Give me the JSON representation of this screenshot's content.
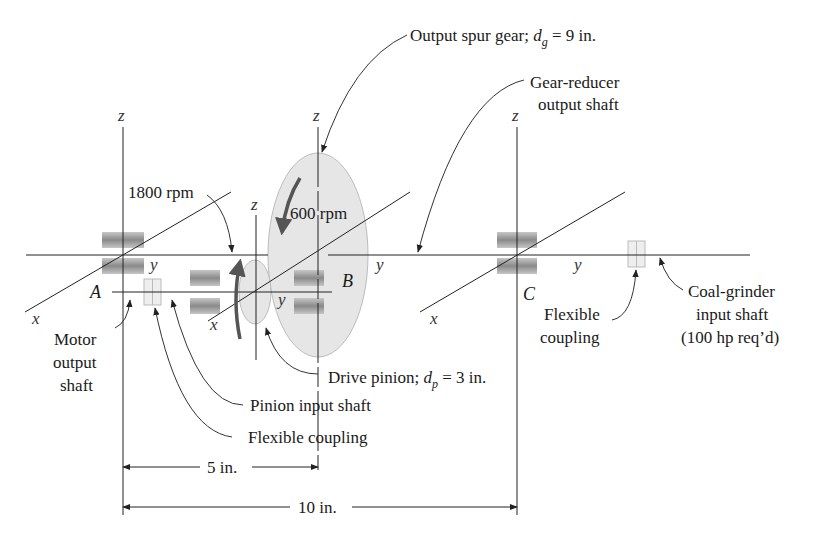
{
  "labels": {
    "output_gear": "Output spur gear; ",
    "output_gear_sym": "d",
    "output_gear_sub": "g",
    "output_gear_val": " = 9 in.",
    "reducer_line1": "Gear-reducer",
    "reducer_line2": "output shaft",
    "rpm_in": "1800 rpm",
    "rpm_out": "600 rpm",
    "motor_line1": "Motor",
    "motor_line2": "output",
    "motor_line3": "shaft",
    "drive_pinion": "Drive pinion; ",
    "drive_pinion_sym": "d",
    "drive_pinion_sub": "p",
    "drive_pinion_val": " = 3 in.",
    "pinion_input": "Pinion input shaft",
    "flex_coupling_bottom": "Flexible coupling",
    "flex_coupling_right_1": "Flexible",
    "flex_coupling_right_2": "coupling",
    "grinder_line1": "Coal-grinder",
    "grinder_line2": "input shaft",
    "grinder_line3": "(100 hp req’d)",
    "dim_5": "5 in.",
    "dim_10": "10 in."
  },
  "points": {
    "A": "A",
    "B": "B",
    "C": "C"
  },
  "axes": {
    "x": "x",
    "y": "y",
    "z": "z"
  },
  "colors": {
    "gear_fill": "#e4e4e4",
    "gear_stroke": "#b8b8b8",
    "bearing": "#8c8c8c",
    "coupling": "#d0d0d0",
    "line": "#222222"
  }
}
